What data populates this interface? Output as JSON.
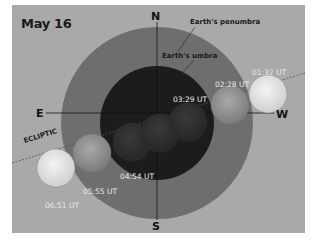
{
  "title": "May 16",
  "labels": {
    "penumbra": "Earth's penumbra",
    "umbra": "Earth's umbra",
    "ecliptic": "ECLIPTIC"
  },
  "directions": {
    "north": "N",
    "south": "S",
    "east": "E",
    "west": "W"
  },
  "moon_positions": [
    {
      "time": "01:32 UT",
      "phase": "penumbral-entry"
    },
    {
      "time": "02:28 UT",
      "phase": "partial-begins"
    },
    {
      "time": "03:29 UT",
      "phase": "totality"
    },
    {
      "time": "04:54 UT",
      "phase": "partial-ends"
    },
    {
      "time": "05:55 UT",
      "phase": "penumbral"
    },
    {
      "time": "06:51 UT",
      "phase": "penumbral-exit"
    }
  ],
  "colors": {
    "background": "#a9a9a9",
    "penumbra": "#6e6e6e",
    "umbra": "#1c1c1c",
    "moon_bright": "#e6e6e6"
  }
}
